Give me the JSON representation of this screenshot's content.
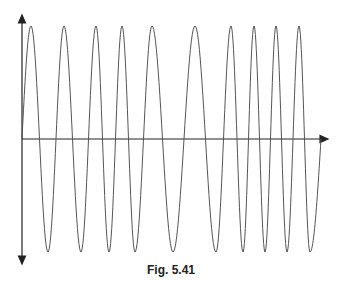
{
  "figure": {
    "caption": "Fig. 5.41"
  },
  "colors": {
    "axis": "#222222",
    "wave": "#555555",
    "background": "#ffffff"
  },
  "diagram": {
    "axis_origin": [
      22,
      139
    ],
    "x_axis_end": 328,
    "y_axis_top": 16,
    "y_axis_bottom": 263,
    "amplitude_top": 26,
    "amplitude_bottom": 252,
    "peaks_x": [
      31,
      64,
      96,
      122,
      152,
      195,
      231,
      254,
      276,
      299
    ],
    "troughs_x": [
      48,
      81,
      109,
      135,
      173,
      216,
      243,
      265,
      287,
      310
    ]
  }
}
